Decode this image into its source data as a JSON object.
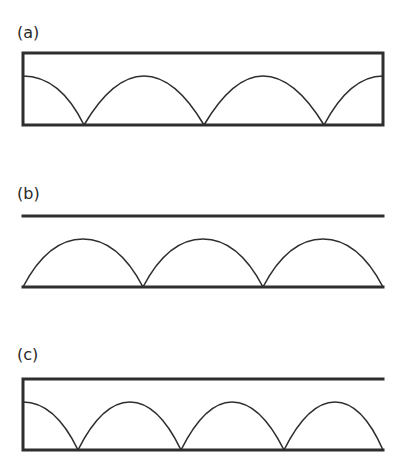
{
  "panels": [
    {
      "id": "a",
      "label": "(a)"
    },
    {
      "id": "b",
      "label": "(b)"
    },
    {
      "id": "c",
      "label": "(c)"
    }
  ],
  "colors": {
    "stroke": "#2e2e2e",
    "background": "#ffffff"
  }
}
